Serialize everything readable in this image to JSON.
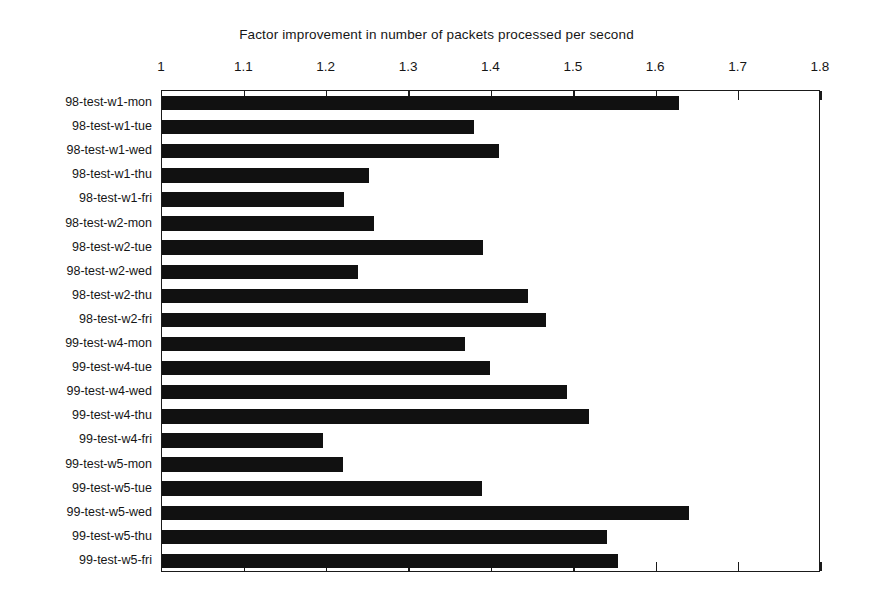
{
  "chart_data": {
    "type": "bar",
    "orientation": "horizontal",
    "title": "Factor improvement in number of packets processed per second",
    "xlabel": "",
    "ylabel": "",
    "xlim": [
      1,
      1.8
    ],
    "xticks": [
      "1",
      "1.1",
      "1.2",
      "1.3",
      "1.4",
      "1.5",
      "1.6",
      "1.7",
      "1.8"
    ],
    "xtick_values": [
      1,
      1.1,
      1.2,
      1.3,
      1.4,
      1.5,
      1.6,
      1.7,
      1.8
    ],
    "grid": false,
    "legend": false,
    "bar_color": "#111111",
    "categories": [
      "98-test-w1-mon",
      "98-test-w1-tue",
      "98-test-w1-wed",
      "98-test-w1-thu",
      "98-test-w1-fri",
      "98-test-w2-mon",
      "98-test-w2-tue",
      "98-test-w2-wed",
      "98-test-w2-thu",
      "98-test-w2-fri",
      "99-test-w4-mon",
      "99-test-w4-tue",
      "99-test-w4-wed",
      "99-test-w4-thu",
      "99-test-w4-fri",
      "99-test-w5-mon",
      "99-test-w5-tue",
      "99-test-w5-wed",
      "99-test-w5-thu",
      "99-test-w5-fri"
    ],
    "values": [
      1.628,
      1.379,
      1.409,
      1.251,
      1.221,
      1.257,
      1.39,
      1.238,
      1.444,
      1.466,
      1.368,
      1.398,
      1.492,
      1.518,
      1.196,
      1.22,
      1.388,
      1.64,
      1.54,
      1.553
    ]
  }
}
